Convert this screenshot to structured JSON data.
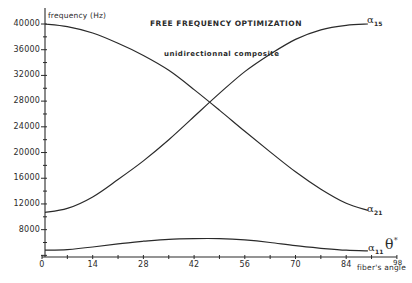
{
  "chart_data": {
    "type": "line",
    "title": "FREE FREQUENCY OPTIMIZATION",
    "subtitle": "unidirectionnal composite",
    "xlabel": "fiber's angle",
    "ylabel": "frequency (Hz)",
    "xlim": [
      0,
      98
    ],
    "ylim": [
      4000,
      40000
    ],
    "x_ticks": [
      "0",
      "14",
      "28",
      "42",
      "56",
      "70",
      "84",
      "98"
    ],
    "y_ticks": [
      "40000",
      "36000",
      "32000",
      "28000",
      "24000",
      "20000",
      "16000",
      "12000",
      "8000"
    ],
    "grid": false,
    "x": [
      0,
      7,
      14,
      21,
      28,
      35,
      42,
      49,
      56,
      63,
      70,
      77,
      84,
      90
    ],
    "series": [
      {
        "name": "α15",
        "label": "α",
        "subscript": "15",
        "values": [
          40000,
          39600,
          38600,
          37000,
          35100,
          32800,
          29800,
          26600,
          23300,
          20100,
          17000,
          14300,
          12100,
          11000
        ]
      },
      {
        "name": "α21",
        "label": "α",
        "subscript": "21",
        "values": [
          10700,
          11300,
          13100,
          15800,
          18700,
          22000,
          25600,
          29200,
          32600,
          35300,
          37600,
          39100,
          39800,
          40000
        ]
      },
      {
        "name": "α11",
        "label": "α",
        "subscript": "11",
        "values": [
          4800,
          4900,
          5300,
          5800,
          6200,
          6500,
          6600,
          6600,
          6400,
          6000,
          5500,
          5100,
          4800,
          4700
        ]
      }
    ],
    "annotations": [
      "θ*"
    ]
  },
  "labels": {
    "title": "FREE FREQUENCY OPTIMIZATION",
    "subtitle": "unidirectionnal composite",
    "ylabel": "frequency (Hz)",
    "xlabel": "fiber's angle",
    "x_end": "98",
    "alpha": "α",
    "alpha15_sub": "15",
    "alpha21_sub": "21",
    "alpha11_sub": "11",
    "theta": "θ",
    "theta_sup": "*"
  },
  "colors": {
    "line": "#2a2a2a",
    "background": "#ffffff"
  }
}
